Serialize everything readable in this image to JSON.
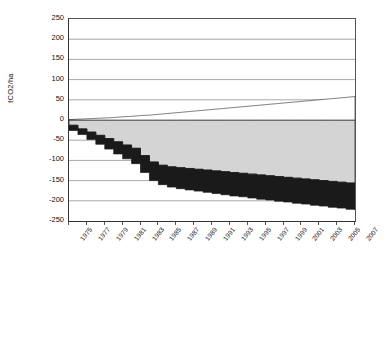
{
  "chart_data": {
    "type": "area",
    "title": "",
    "xlabel": "",
    "ylabel": "tCO2/ha",
    "ylim": [
      -250,
      250
    ],
    "ytick_step": 50,
    "yticks": [
      250,
      200,
      150,
      100,
      50,
      0,
      -50,
      -100,
      -150,
      -200,
      -250
    ],
    "xlim": [
      1975,
      2007
    ],
    "xticks": [
      1975,
      1977,
      1979,
      1981,
      1983,
      1985,
      1987,
      1989,
      1991,
      1993,
      1995,
      1997,
      1999,
      2001,
      2003,
      2005,
      2007
    ],
    "grid": "horizontal",
    "legend_position": "bottom",
    "x": [
      1975,
      1976,
      1977,
      1978,
      1979,
      1980,
      1981,
      1982,
      1983,
      1984,
      1985,
      1986,
      1987,
      1988,
      1989,
      1990,
      1991,
      1992,
      1993,
      1994,
      1995,
      1996,
      1997,
      1998,
      1999,
      2000,
      2001,
      2002,
      2003,
      2004,
      2005,
      2006,
      2007
    ],
    "series": [
      {
        "name": "Carbon captured from fermentation",
        "fill": "#ffffff",
        "values": [
          0,
          0,
          0,
          0,
          0,
          0,
          0,
          0,
          2,
          3,
          4,
          5,
          6,
          7,
          8,
          9,
          11,
          13,
          15,
          17,
          19,
          21,
          24,
          27,
          30,
          34,
          38,
          42,
          46,
          50,
          55,
          60,
          66
        ]
      },
      {
        "name": "Avoided emissions due to bioelectricity use",
        "fill": "#1a1a1a",
        "values": [
          0,
          0,
          0,
          0,
          0,
          0,
          0,
          0,
          0,
          0,
          1,
          1,
          1,
          1,
          2,
          2,
          2,
          2,
          3,
          3,
          3,
          4,
          4,
          4,
          5,
          5,
          6,
          6,
          7,
          7,
          8,
          8,
          9
        ]
      },
      {
        "name": "Avoided emissions due to biofuel use",
        "fill": "#9a9a9a",
        "values": [
          0,
          0,
          0,
          1,
          2,
          3,
          5,
          7,
          10,
          14,
          18,
          23,
          28,
          34,
          40,
          47,
          55,
          63,
          72,
          82,
          92,
          103,
          114,
          126,
          139,
          152,
          166,
          180,
          195,
          210,
          226,
          242,
          259
        ]
      },
      {
        "name": "Sugar cane grown annually",
        "fill": "#d4d4d4",
        "values": [
          12,
          14,
          17,
          20,
          24,
          28,
          33,
          38,
          44,
          50,
          56,
          62,
          68,
          74,
          80,
          86,
          92,
          98,
          104,
          110,
          116,
          121,
          126,
          131,
          136,
          140,
          144,
          148,
          151,
          154,
          157,
          159,
          161
        ]
      },
      {
        "name": "Sugar cane belowground biomass",
        "fill": "#6e6e6e",
        "values": [
          2,
          3,
          3,
          4,
          5,
          5,
          6,
          7,
          8,
          8,
          9,
          10,
          10,
          11,
          12,
          12,
          13,
          13,
          14,
          14,
          15,
          15,
          16,
          16,
          17,
          17,
          17,
          18,
          18,
          18,
          19,
          19,
          19
        ]
      },
      {
        "name": "Litter input to soil carbon",
        "fill": "#ffffff",
        "values": [
          1,
          2,
          3,
          4,
          5,
          6,
          8,
          9,
          11,
          12,
          14,
          16,
          18,
          20,
          22,
          24,
          26,
          28,
          30,
          32,
          34,
          36,
          38,
          40,
          42,
          44,
          46,
          48,
          50,
          52,
          54,
          56,
          58
        ]
      },
      {
        "name": "Root input to soil carbon",
        "fill": "#b4b4b4",
        "values": [
          1,
          1,
          2,
          3,
          4,
          4,
          5,
          6,
          7,
          8,
          9,
          10,
          11,
          12,
          13,
          14,
          15,
          16,
          17,
          18,
          19,
          20,
          21,
          22,
          23,
          24,
          25,
          26,
          27,
          28,
          29,
          30,
          31
        ]
      },
      {
        "name": "Soil carbon from previous land use",
        "fill": "#1a1a1a",
        "values": [
          -13,
          -14,
          -18,
          -22,
          -26,
          -30,
          -34,
          -38,
          -42,
          -46,
          -48,
          -50,
          -52,
          -53,
          -54,
          -55,
          -56,
          -57,
          -58,
          -58,
          -59,
          -60,
          -60,
          -61,
          -61,
          -62,
          -62,
          -63,
          -63,
          -64,
          -64,
          -65,
          -65
        ]
      },
      {
        "name": "Above and belowground carbon stocks from previous land use",
        "fill": "#d4d4d4",
        "values": [
          -13,
          -22,
          -30,
          -38,
          -46,
          -54,
          -62,
          -70,
          -88,
          -104,
          -112,
          -116,
          -118,
          -120,
          -122,
          -124,
          -126,
          -128,
          -130,
          -132,
          -134,
          -136,
          -138,
          -140,
          -142,
          -144,
          -146,
          -148,
          -150,
          -152,
          -154,
          -156,
          -158
        ]
      },
      {
        "name": "Limit of negative emissions",
        "fill": "none",
        "line": "#1a1a1a",
        "values": [
          -13,
          -25,
          -38,
          -50,
          -63,
          -75,
          -88,
          -100,
          -140,
          -148,
          -148,
          -150,
          -150,
          -152,
          -152,
          -155,
          -150,
          -138,
          -140,
          -142,
          -145,
          -162,
          -158,
          -155,
          -150,
          -138,
          -142,
          -148,
          -152,
          -158,
          -162,
          -168,
          -205
        ]
      }
    ]
  },
  "axis": {
    "y_title": "tCO2/ha",
    "y_ticks": [
      "250",
      "200",
      "150",
      "100",
      "50",
      "0",
      "-50",
      "-100",
      "-150",
      "-200",
      "-250"
    ],
    "x_ticks": [
      "1975",
      "1977",
      "1979",
      "1981",
      "1983",
      "1985",
      "1987",
      "1989",
      "1991",
      "1993",
      "1995",
      "1997",
      "1999",
      "2001",
      "2003",
      "2005",
      "2007"
    ]
  },
  "legend": {
    "items": [
      {
        "label": "Carbon captured from fermentation",
        "swatch": "#ffffff",
        "bordered": true,
        "col": 0,
        "row": 0
      },
      {
        "label": "Avoided emissions due to bioelectricity use",
        "swatch": "#1a1a1a",
        "bordered": true,
        "col": 1,
        "row": 0
      },
      {
        "label": "Avoided emissions due to biofuel use",
        "swatch": "#9a9a9a",
        "bordered": true,
        "col": 0,
        "row": 1
      },
      {
        "label": "Sugar cane  grown annually",
        "swatch": "#d4d4d4",
        "bordered": true,
        "col": 1,
        "row": 1
      },
      {
        "label": "Sugar cane  belowground biomass",
        "swatch": "#6e6e6e",
        "bordered": true,
        "col": 0,
        "row": 2
      },
      {
        "label": "Litter input to soil carbon",
        "swatch": "#ffffff",
        "bordered": true,
        "col": 1,
        "row": 2
      },
      {
        "label": "Root input to soil carbon",
        "swatch": "#b4b4b4",
        "bordered": true,
        "col": 0,
        "row": 3
      },
      {
        "label": "Soil carbon from previous land use",
        "swatch": "#1a1a1a",
        "bordered": true,
        "col": 1,
        "row": 3
      },
      {
        "label": "Above and belowground carbon stocks from previous land use",
        "swatch": "#d4d4d4",
        "bordered": true,
        "col": 0,
        "row": 4
      },
      {
        "label": "Limit of negative emissions",
        "swatch": "none",
        "bordered": false,
        "col": 1,
        "row": 4
      }
    ]
  }
}
